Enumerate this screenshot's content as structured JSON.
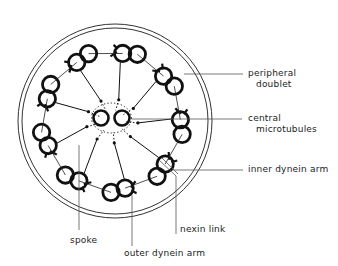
{
  "diagram": {
    "colors": {
      "ink": "#111111",
      "line": "#555555",
      "background": "#ffffff"
    },
    "labels": {
      "peripheral_doublet_1": "peripheral",
      "peripheral_doublet_2": "doublet",
      "central_microtubules_1": "central",
      "central_microtubules_2": "microtubules",
      "inner_dynein_arm": "inner dynein arm",
      "nexin_link": "nexin link",
      "spoke": "spoke",
      "outer_dynein_arm": "outer dynein arm"
    },
    "structure": {
      "peripheral_doublet_count": 9,
      "central_microtubule_count": 2
    }
  }
}
